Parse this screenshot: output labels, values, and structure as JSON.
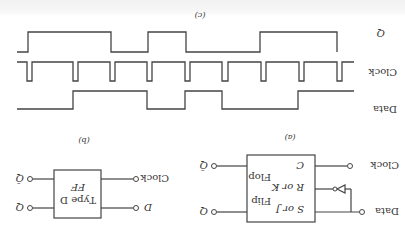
{
  "orientation": "rotated-180",
  "panel_a": {
    "caption": "(a)",
    "block": {
      "line1": "Flip",
      "line2": "Flop"
    },
    "inputs": {
      "data": "Data",
      "clock": "Clock"
    },
    "pins": {
      "s": "S or J",
      "r": "R or K",
      "c": "C"
    },
    "outputs": {
      "q": "Q",
      "qbar": "Q̄"
    },
    "inverter": "inverter on R input"
  },
  "panel_b": {
    "caption": "(b)",
    "block": {
      "line1": "Type D",
      "line2": "FF"
    },
    "inputs": {
      "d": "D",
      "clock": "Clock"
    },
    "outputs": {
      "q": "Q",
      "qbar": "Q̄"
    }
  },
  "panel_c": {
    "caption": "(c)",
    "signals": [
      {
        "name": "Data",
        "levels": [
          0,
          1,
          1,
          1,
          0,
          1,
          0,
          0,
          1,
          1
        ]
      },
      {
        "name": "Clock",
        "pulses": 9,
        "pulse_type": "negative-going"
      },
      {
        "name": "Q",
        "levels": [
          0,
          1,
          1,
          0,
          1,
          0,
          0,
          1,
          1
        ]
      }
    ]
  }
}
